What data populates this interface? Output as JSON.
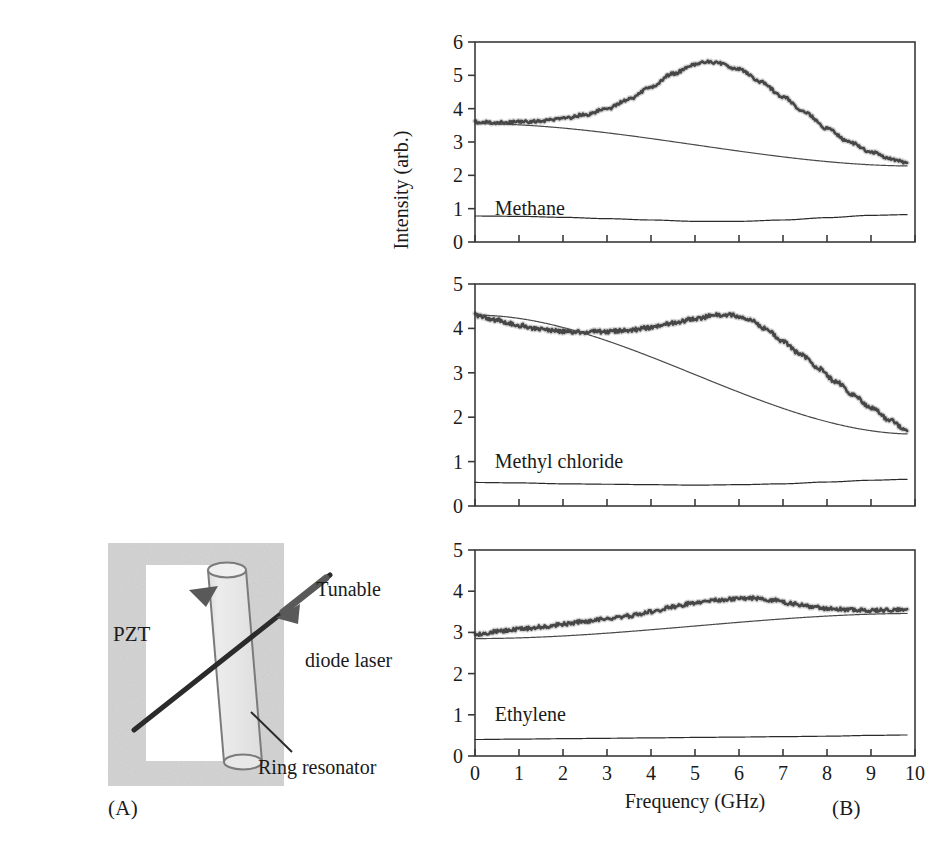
{
  "figure": {
    "panels": [
      {
        "tag": "(A)",
        "name": "schematic"
      },
      {
        "tag": "(B)",
        "name": "spectra"
      }
    ]
  },
  "schematic": {
    "labels": {
      "pzt": "PZT",
      "tunable_diode_laser": "Tunable\ndiode laser",
      "tunable_diode_laser_line1": "Tunable",
      "tunable_diode_laser_line2": "diode laser",
      "ring_resonator": "Ring resonator"
    },
    "colors": {
      "pzt_block_fill": "#d2d2d2",
      "cylinder_fill": "#e8e8e8",
      "cylinder_stroke": "#7b7b7b",
      "beam_stroke": "#2b2b2b",
      "arrow_fill": "#595959",
      "leader_stroke": "#2b2b2b",
      "background": "#ffffff"
    }
  },
  "chart_data": [
    {
      "type": "line",
      "title": "Methane",
      "xlabel": "Frequency (GHz)",
      "ylabel": "Intensity (arb.)",
      "xlim": [
        0,
        10
      ],
      "ylim": [
        0,
        6
      ],
      "xticks": [
        0,
        1,
        2,
        3,
        4,
        5,
        6,
        7,
        8,
        9,
        10
      ],
      "yticks": [
        0,
        1,
        2,
        3,
        4,
        5,
        6
      ],
      "grid": false,
      "legend": "none",
      "annotation": "Methane",
      "series": [
        {
          "name": "signal",
          "role": "measured-spectrum",
          "color": "#3a3a3a",
          "noisy": true,
          "x": [
            0,
            0.5,
            1,
            1.5,
            2,
            2.5,
            3,
            3.5,
            4,
            4.5,
            5,
            5.25,
            5.5,
            6,
            6.5,
            7,
            7.5,
            8,
            8.5,
            9,
            9.5,
            9.8
          ],
          "values": [
            3.6,
            3.58,
            3.6,
            3.63,
            3.7,
            3.82,
            4.0,
            4.28,
            4.65,
            5.05,
            5.33,
            5.4,
            5.38,
            5.18,
            4.8,
            4.35,
            3.88,
            3.4,
            3.0,
            2.7,
            2.48,
            2.38
          ]
        },
        {
          "name": "baseline",
          "role": "linear-background",
          "color": "#4a4a4a",
          "noisy": false,
          "x": [
            0,
            10
          ],
          "values": [
            3.55,
            2.28
          ]
        },
        {
          "name": "reference",
          "role": "lower-trace",
          "color": "#2b2b2b",
          "noisy": false,
          "x": [
            0,
            1,
            2,
            3,
            4,
            5,
            6,
            7,
            8,
            9,
            9.8
          ],
          "values": [
            0.78,
            0.77,
            0.74,
            0.7,
            0.66,
            0.62,
            0.62,
            0.66,
            0.73,
            0.8,
            0.82
          ]
        }
      ]
    },
    {
      "type": "line",
      "title": "Methyl chloride",
      "xlabel": "Frequency (GHz)",
      "ylabel": "Intensity (arb.)",
      "xlim": [
        0,
        10
      ],
      "ylim": [
        0,
        5
      ],
      "xticks": [
        0,
        1,
        2,
        3,
        4,
        5,
        6,
        7,
        8,
        9,
        10
      ],
      "yticks": [
        0,
        1,
        2,
        3,
        4,
        5
      ],
      "grid": false,
      "legend": "none",
      "annotation": "Methyl chloride",
      "series": [
        {
          "name": "signal",
          "role": "measured-spectrum",
          "color": "#3a3a3a",
          "noisy": true,
          "x": [
            0,
            0.5,
            1,
            1.5,
            2,
            2.5,
            3,
            3.5,
            4,
            4.5,
            5,
            5.5,
            5.8,
            6.2,
            6.6,
            7,
            7.4,
            7.8,
            8.2,
            8.6,
            9,
            9.4,
            9.8
          ],
          "values": [
            4.3,
            4.18,
            4.07,
            3.98,
            3.93,
            3.92,
            3.93,
            3.96,
            4.02,
            4.12,
            4.22,
            4.3,
            4.3,
            4.22,
            4.0,
            3.7,
            3.42,
            3.1,
            2.8,
            2.5,
            2.22,
            1.95,
            1.72
          ]
        },
        {
          "name": "baseline",
          "role": "linear-background",
          "color": "#4a4a4a",
          "noisy": false,
          "x": [
            0,
            10
          ],
          "values": [
            4.3,
            1.62
          ]
        },
        {
          "name": "reference",
          "role": "lower-trace",
          "color": "#2b2b2b",
          "noisy": false,
          "x": [
            0,
            1,
            2,
            3,
            4,
            5,
            6,
            7,
            8,
            9,
            9.8
          ],
          "values": [
            0.53,
            0.52,
            0.5,
            0.49,
            0.48,
            0.47,
            0.48,
            0.5,
            0.54,
            0.58,
            0.6
          ]
        }
      ]
    },
    {
      "type": "line",
      "title": "Ethylene",
      "xlabel": "Frequency (GHz)",
      "ylabel": "Intensity (arb.)",
      "xlim": [
        0,
        10
      ],
      "ylim": [
        0,
        5
      ],
      "xticks": [
        0,
        1,
        2,
        3,
        4,
        5,
        6,
        7,
        8,
        9,
        10
      ],
      "yticks": [
        0,
        1,
        2,
        3,
        4,
        5
      ],
      "grid": false,
      "legend": "none",
      "annotation": "Ethylene",
      "series": [
        {
          "name": "signal",
          "role": "measured-spectrum",
          "color": "#3a3a3a",
          "noisy": true,
          "x": [
            0,
            0.5,
            1,
            1.5,
            2,
            2.5,
            3,
            3.5,
            4,
            4.5,
            5,
            5.5,
            6,
            6.3,
            6.8,
            7.2,
            7.6,
            8,
            8.5,
            9,
            9.5,
            9.8
          ],
          "values": [
            2.95,
            3.02,
            3.08,
            3.13,
            3.2,
            3.27,
            3.33,
            3.4,
            3.5,
            3.62,
            3.72,
            3.78,
            3.82,
            3.83,
            3.78,
            3.7,
            3.63,
            3.58,
            3.55,
            3.53,
            3.54,
            3.56
          ]
        },
        {
          "name": "baseline",
          "role": "linear-background",
          "color": "#4a4a4a",
          "noisy": false,
          "x": [
            0,
            10
          ],
          "values": [
            2.85,
            3.46
          ]
        },
        {
          "name": "reference",
          "role": "lower-trace",
          "color": "#2b2b2b",
          "noisy": false,
          "x": [
            0,
            1,
            2,
            3,
            4,
            5,
            6,
            7,
            8,
            9,
            9.8
          ],
          "values": [
            0.4,
            0.41,
            0.42,
            0.43,
            0.44,
            0.45,
            0.46,
            0.47,
            0.48,
            0.5,
            0.51
          ]
        }
      ]
    }
  ],
  "axes": {
    "x_title": "Frequency (GHz)",
    "y_title": "Intensity (arb.)",
    "x_tick_labels": [
      "0",
      "1",
      "2",
      "3",
      "4",
      "5",
      "6",
      "7",
      "8",
      "9",
      "10"
    ],
    "y_tick_labels_6": [
      "0",
      "1",
      "2",
      "3",
      "4",
      "5",
      "6"
    ],
    "y_tick_labels_5": [
      "0",
      "1",
      "2",
      "3",
      "4",
      "5"
    ]
  }
}
